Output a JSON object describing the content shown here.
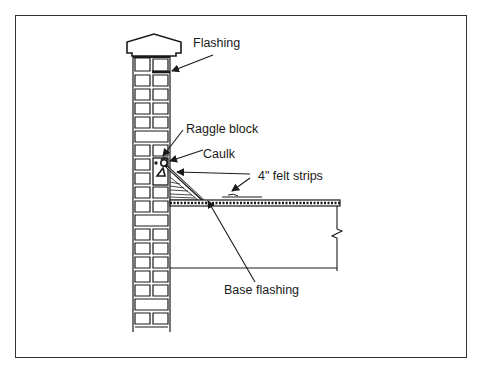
{
  "figure": {
    "type": "construction detail",
    "border_color": "#333333",
    "line_color": "#1a1a1a"
  },
  "labels": {
    "flashing": "Flashing",
    "raggle_block": "Raggle block",
    "caulk": "Caulk",
    "felt_strips": "4\" felt strips",
    "base_flashing": "Base flashing"
  }
}
